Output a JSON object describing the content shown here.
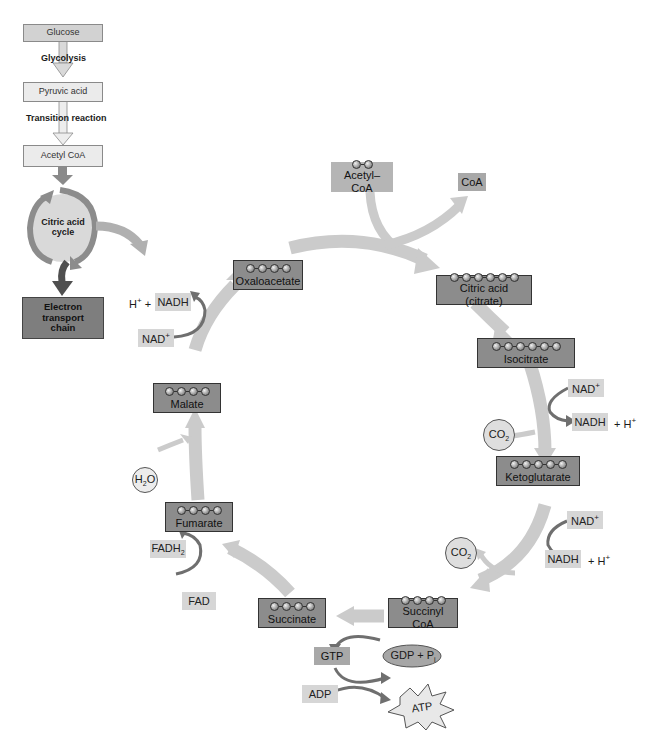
{
  "overview": {
    "steps": [
      {
        "label": "Glucose"
      },
      {
        "label": "Pyruvic acid"
      },
      {
        "label": "Acetyl CoA"
      },
      {
        "label": "Citric acid cycle"
      },
      {
        "label": "Electron transport chain"
      }
    ],
    "transitions": [
      "Glycolysis",
      "Transition reaction"
    ],
    "cycle_label_line1": "Citric acid",
    "cycle_label_line2": "cycle",
    "etc_line1": "Electron",
    "etc_line2": "transport",
    "etc_line3": "chain"
  },
  "cycle": {
    "input": {
      "label": "Acetyl–CoA",
      "carbons": 2
    },
    "output_coa": "CoA",
    "molecules": [
      {
        "id": "oxaloacetate",
        "label": "Oxaloacetate",
        "carbons": 4
      },
      {
        "id": "citrate",
        "label": "Citric acid (citrate)",
        "carbons": 6
      },
      {
        "id": "isocitrate",
        "label": "Isocitrate",
        "carbons": 6
      },
      {
        "id": "ketoglutarate",
        "label": "Ketoglutarate",
        "carbons": 5
      },
      {
        "id": "succinyl-coa",
        "label": "Succinyl CoA",
        "carbons": 4
      },
      {
        "id": "succinate",
        "label": "Succinate",
        "carbons": 4
      },
      {
        "id": "fumarate",
        "label": "Fumarate",
        "carbons": 4
      },
      {
        "id": "malate",
        "label": "Malate",
        "carbons": 4
      }
    ],
    "cofactors": {
      "nad_plus": "NAD",
      "plus_sign": "+",
      "nadh": "NADH",
      "h_plus": "+ H",
      "h_plus_prefix": "H",
      "h_plus_prefix_suffix": " +",
      "co2_main": "CO",
      "co2_sub": "2",
      "h2o_h": "H",
      "h2o_sub": "2",
      "h2o_o": "O",
      "fad": "FAD",
      "fadh2_main": "FADH",
      "fadh2_sub": "2",
      "gtp": "GTP",
      "gdp_pi": "GDP + P",
      "gdp_pi_sub": "i",
      "adp": "ADP",
      "atp": "ATP"
    }
  },
  "colors": {
    "arrow_light": "#c9c9c9",
    "arrow_dark": "#6f6f6f",
    "molecule_box": "#8c8c8c",
    "cofactor_box": "#d6d6d6",
    "flow_box": "#d2d2d2",
    "etc_box": "#7e7e7e"
  }
}
